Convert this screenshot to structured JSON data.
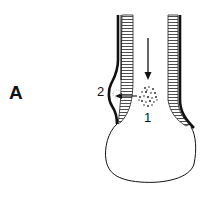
{
  "figure": {
    "panel_label": "A",
    "labels": {
      "one": "1",
      "two": "2"
    },
    "colors": {
      "ink": "#111111",
      "background": "#ffffff"
    }
  }
}
